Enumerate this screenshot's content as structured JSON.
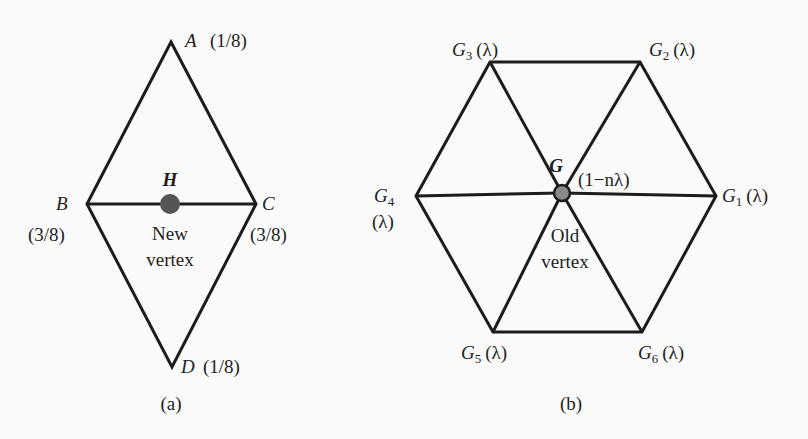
{
  "figure_a": {
    "caption": "(a)",
    "vertices": {
      "A": {
        "name": "A",
        "weight": "(1/8)"
      },
      "B": {
        "name": "B",
        "weight": "(3/8)"
      },
      "C": {
        "name": "C",
        "weight": "(3/8)"
      },
      "D": {
        "name": "D",
        "weight": "(1/8)"
      }
    },
    "new_point": {
      "name": "H",
      "label_line1": "New",
      "label_line2": "vertex",
      "color": "#555555"
    }
  },
  "figure_b": {
    "caption": "(b)",
    "center": {
      "name": "G",
      "weight": "(1−nλ)",
      "label_line1": "Old",
      "label_line2": "vertex",
      "color": "#8a8a8a"
    },
    "neighbors": [
      {
        "name": "G",
        "sub": "1",
        "weight": "(λ)"
      },
      {
        "name": "G",
        "sub": "2",
        "weight": "(λ)"
      },
      {
        "name": "G",
        "sub": "3",
        "weight": "(λ)"
      },
      {
        "name": "G",
        "sub": "4",
        "weight": "(λ)"
      },
      {
        "name": "G",
        "sub": "5",
        "weight": "(λ)"
      },
      {
        "name": "G",
        "sub": "6",
        "weight": "(λ)"
      }
    ]
  }
}
